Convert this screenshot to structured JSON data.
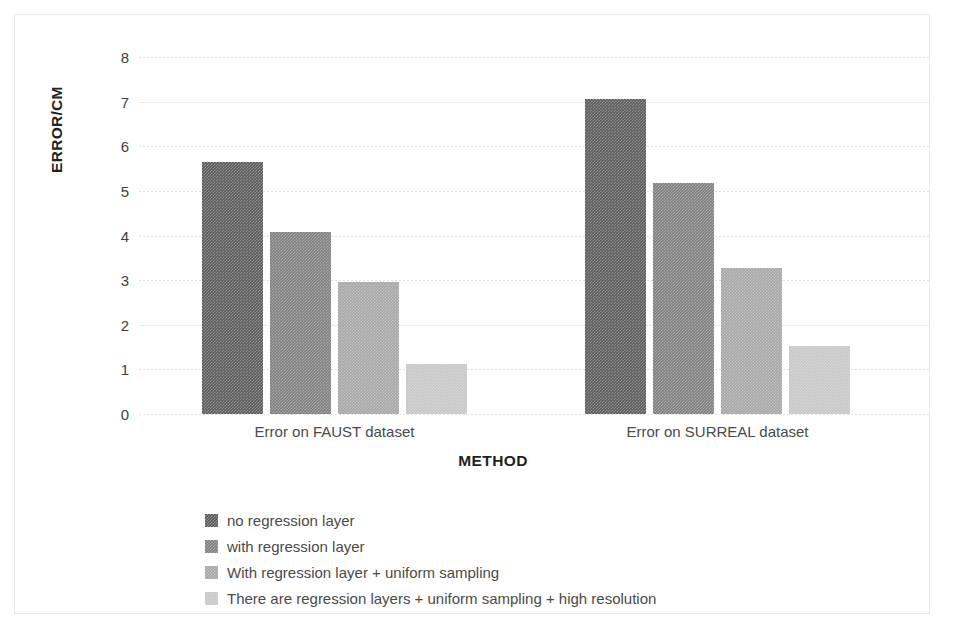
{
  "chart_data": {
    "type": "bar",
    "title": "",
    "xlabel": "METHOD",
    "ylabel": "ERROR/CM",
    "categories": [
      "Error on FAUST dataset",
      "Error on SURREAL dataset"
    ],
    "ylim": [
      0,
      8
    ],
    "yticks": [
      "0",
      "1",
      "2",
      "3",
      "4",
      "5",
      "6",
      "7",
      "8"
    ],
    "grid": true,
    "legend_position": "bottom-left",
    "series": [
      {
        "name": "no regression layer",
        "color": "#5c5c5c",
        "values": [
          5.64,
          7.05
        ]
      },
      {
        "name": "with regression layer",
        "color": "#808080",
        "values": [
          4.07,
          5.17
        ]
      },
      {
        "name": "With regression layer + uniform sampling",
        "color": "#a6a6a6",
        "values": [
          2.95,
          3.27
        ]
      },
      {
        "name": "There are regression layers + uniform sampling + high resolution",
        "color": "#c6c6c6",
        "values": [
          1.13,
          1.52
        ]
      }
    ]
  },
  "axes": {
    "y_title": "ERROR/CM",
    "x_title": "METHOD",
    "y_ticks": [
      {
        "label": "8",
        "value": 8
      },
      {
        "label": "7",
        "value": 7
      },
      {
        "label": "6",
        "value": 6
      },
      {
        "label": "5",
        "value": 5
      },
      {
        "label": "4",
        "value": 4
      },
      {
        "label": "3",
        "value": 3
      },
      {
        "label": "2",
        "value": 2
      },
      {
        "label": "1",
        "value": 1
      },
      {
        "label": "0",
        "value": 0
      }
    ],
    "x_categories": [
      {
        "label": "Error on FAUST dataset"
      },
      {
        "label": "Error on SURREAL dataset"
      }
    ]
  },
  "legend": {
    "items": [
      {
        "label": "no regression layer",
        "color": "#5c5c5c"
      },
      {
        "label": "with regression layer",
        "color": "#808080"
      },
      {
        "label": "With regression layer + uniform sampling",
        "color": "#a6a6a6"
      },
      {
        "label": "There are regression layers + uniform sampling + high resolution",
        "color": "#c6c6c6"
      }
    ]
  }
}
